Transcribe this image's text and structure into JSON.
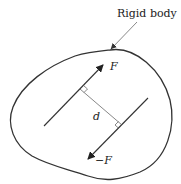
{
  "diagram": {
    "labels": {
      "body": "Rigid body",
      "force_top": "F",
      "force_bottom": "−F",
      "distance": "d"
    },
    "colors": {
      "stroke": "#333333",
      "thin_stroke": "#555555",
      "text": "#222222",
      "background": "#ffffff"
    },
    "elements": [
      {
        "type": "closed-curve",
        "name": "rigid-body-outline"
      },
      {
        "type": "arrow",
        "name": "force-F",
        "direction": "up-right"
      },
      {
        "type": "arrow",
        "name": "force-minus-F",
        "direction": "down-left"
      },
      {
        "type": "segment",
        "name": "perpendicular-distance-d"
      },
      {
        "type": "leader-arrow",
        "name": "rigid-body-pointer"
      }
    ]
  }
}
